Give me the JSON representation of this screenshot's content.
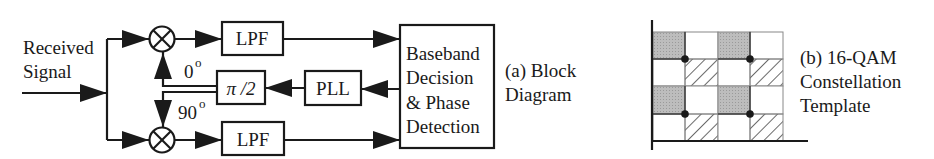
{
  "block_diagram": {
    "input_label_line1": "Received",
    "input_label_line2": "Signal",
    "top_lpf": "LPF",
    "bottom_lpf": "LPF",
    "phase_shifter": "π /2",
    "pll": "PLL",
    "phase_0": "0",
    "phase_90": "90",
    "degree_mark": "o",
    "decision_block": [
      "Baseband",
      "Decision",
      "& Phase",
      "Detection"
    ],
    "caption_line1": "(a) Block",
    "caption_line2": "Diagram"
  },
  "constellation": {
    "caption_line1": "(b) 16-QAM",
    "caption_line2": "Constellation",
    "caption_line3": "Template",
    "grid": [
      [
        "gray",
        "white",
        "gray",
        "white"
      ],
      [
        "white",
        "hatch",
        "white",
        "hatch"
      ],
      [
        "gray",
        "white",
        "gray",
        "white"
      ],
      [
        "white",
        "hatch",
        "white",
        "hatch"
      ]
    ],
    "colors": {
      "gray": "#b5b5b5",
      "line": "#1a1a1a"
    }
  }
}
